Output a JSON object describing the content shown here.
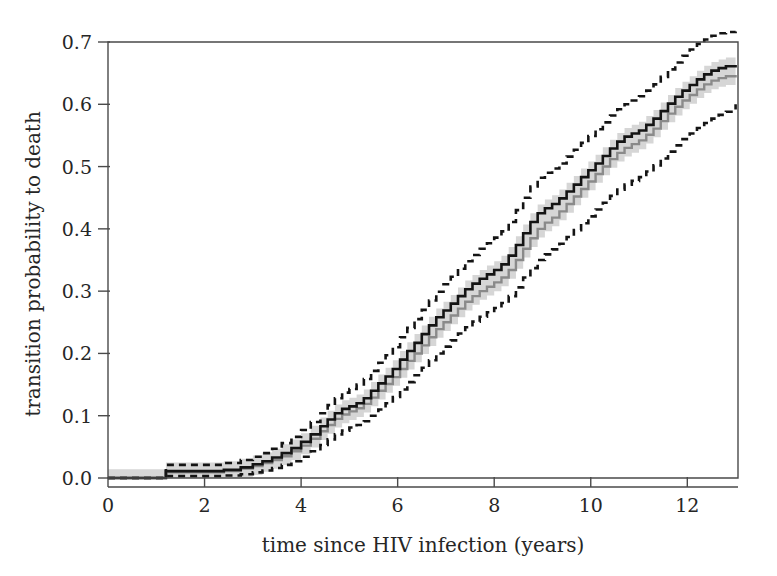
{
  "chart_data": {
    "type": "line",
    "title": "",
    "subtitle": "",
    "xlabel": "time since HIV infection (years)",
    "ylabel": "transition probability to death",
    "xlim": [
      0,
      13.05
    ],
    "ylim": [
      0.0,
      0.715
    ],
    "xticks": [
      0,
      2,
      4,
      6,
      8,
      10,
      12
    ],
    "xticklabels": [
      "0",
      "2",
      "4",
      "6",
      "8",
      "10",
      "12"
    ],
    "yticks": [
      0.0,
      0.1,
      0.2,
      0.3,
      0.4,
      0.5,
      0.6,
      0.7
    ],
    "yticklabels": [
      "0.0",
      "0.1",
      "0.2",
      "0.3",
      "0.4",
      "0.5",
      "0.6",
      "0.7"
    ],
    "grid": false,
    "legend": "none",
    "colors": {
      "estimate": "#141414",
      "second_estimate": "#8a8a8a",
      "confidence_band_fill": "#d6d6d6",
      "confidence_bound_line": "#141414",
      "axis": "#4a4a4a",
      "text": "#262626"
    },
    "step_interpolation": true,
    "series": [
      {
        "name": "estimate",
        "style": "solid-black",
        "x": [
          0.0,
          1.18,
          1.2,
          2.0,
          2.4,
          2.75,
          3.0,
          3.2,
          3.4,
          3.6,
          3.8,
          4.0,
          4.2,
          4.4,
          4.55,
          4.7,
          4.85,
          5.0,
          5.15,
          5.3,
          5.45,
          5.6,
          5.75,
          5.9,
          6.05,
          6.2,
          6.35,
          6.5,
          6.65,
          6.8,
          6.95,
          7.1,
          7.25,
          7.4,
          7.55,
          7.7,
          7.85,
          8.0,
          8.15,
          8.3,
          8.45,
          8.6,
          8.75,
          8.9,
          9.05,
          9.2,
          9.35,
          9.5,
          9.65,
          9.8,
          9.95,
          10.1,
          10.25,
          10.4,
          10.55,
          10.7,
          10.85,
          11.0,
          11.15,
          11.3,
          11.45,
          11.6,
          11.75,
          11.9,
          12.05,
          12.2,
          12.35,
          12.5,
          12.65,
          12.8,
          13.0
        ],
        "y": [
          0.0,
          0.0,
          0.011,
          0.011,
          0.013,
          0.017,
          0.022,
          0.027,
          0.033,
          0.04,
          0.048,
          0.058,
          0.07,
          0.083,
          0.094,
          0.104,
          0.111,
          0.115,
          0.12,
          0.128,
          0.14,
          0.152,
          0.163,
          0.175,
          0.19,
          0.204,
          0.217,
          0.231,
          0.245,
          0.258,
          0.269,
          0.28,
          0.292,
          0.303,
          0.312,
          0.32,
          0.327,
          0.334,
          0.343,
          0.357,
          0.374,
          0.393,
          0.411,
          0.425,
          0.433,
          0.44,
          0.449,
          0.46,
          0.471,
          0.483,
          0.494,
          0.505,
          0.517,
          0.529,
          0.54,
          0.548,
          0.553,
          0.558,
          0.567,
          0.577,
          0.589,
          0.601,
          0.612,
          0.622,
          0.631,
          0.64,
          0.648,
          0.654,
          0.658,
          0.661,
          0.663
        ]
      },
      {
        "name": "second-estimate",
        "style": "solid-gray",
        "x": [
          0.0,
          1.18,
          1.2,
          2.0,
          2.4,
          2.75,
          3.0,
          3.2,
          3.4,
          3.6,
          3.8,
          4.0,
          4.2,
          4.4,
          4.55,
          4.7,
          4.85,
          5.0,
          5.15,
          5.3,
          5.45,
          5.6,
          5.75,
          5.9,
          6.05,
          6.2,
          6.35,
          6.5,
          6.65,
          6.8,
          6.95,
          7.1,
          7.25,
          7.4,
          7.55,
          7.7,
          7.85,
          8.0,
          8.15,
          8.3,
          8.45,
          8.6,
          8.75,
          8.9,
          9.05,
          9.2,
          9.35,
          9.5,
          9.65,
          9.8,
          9.95,
          10.1,
          10.25,
          10.4,
          10.55,
          10.7,
          10.85,
          11.0,
          11.15,
          11.3,
          11.45,
          11.6,
          11.75,
          11.9,
          12.05,
          12.2,
          12.35,
          12.5,
          12.65,
          12.8,
          13.0
        ],
        "y": [
          0.0,
          0.0,
          0.009,
          0.009,
          0.011,
          0.015,
          0.019,
          0.024,
          0.029,
          0.035,
          0.043,
          0.052,
          0.063,
          0.075,
          0.085,
          0.095,
          0.102,
          0.107,
          0.112,
          0.119,
          0.129,
          0.14,
          0.151,
          0.162,
          0.175,
          0.188,
          0.2,
          0.213,
          0.226,
          0.239,
          0.25,
          0.261,
          0.272,
          0.283,
          0.292,
          0.3,
          0.307,
          0.314,
          0.322,
          0.334,
          0.35,
          0.368,
          0.385,
          0.4,
          0.41,
          0.418,
          0.428,
          0.44,
          0.452,
          0.464,
          0.476,
          0.488,
          0.5,
          0.512,
          0.522,
          0.53,
          0.536,
          0.542,
          0.551,
          0.561,
          0.573,
          0.585,
          0.596,
          0.606,
          0.615,
          0.624,
          0.632,
          0.638,
          0.642,
          0.645,
          0.647
        ]
      },
      {
        "name": "upper-confidence-bound",
        "style": "dotted",
        "x": [
          0.0,
          1.18,
          1.2,
          2.0,
          2.4,
          2.75,
          3.0,
          3.2,
          3.4,
          3.6,
          3.8,
          4.0,
          4.2,
          4.4,
          4.55,
          4.7,
          4.85,
          5.0,
          5.15,
          5.3,
          5.45,
          5.6,
          5.75,
          5.9,
          6.05,
          6.2,
          6.35,
          6.5,
          6.65,
          6.8,
          6.95,
          7.1,
          7.25,
          7.4,
          7.55,
          7.7,
          7.85,
          8.0,
          8.15,
          8.3,
          8.45,
          8.6,
          8.75,
          8.9,
          9.05,
          9.2,
          9.35,
          9.5,
          9.65,
          9.8,
          9.95,
          10.1,
          10.25,
          10.4,
          10.55,
          10.7,
          10.85,
          11.0,
          11.15,
          11.3,
          11.45,
          11.6,
          11.75,
          11.9,
          12.05,
          12.2,
          12.35,
          12.5,
          12.65,
          12.8,
          13.0
        ],
        "y": [
          0.0,
          0.0,
          0.021,
          0.021,
          0.024,
          0.029,
          0.034,
          0.04,
          0.047,
          0.056,
          0.066,
          0.077,
          0.09,
          0.104,
          0.117,
          0.128,
          0.137,
          0.143,
          0.15,
          0.159,
          0.172,
          0.185,
          0.197,
          0.21,
          0.226,
          0.241,
          0.255,
          0.27,
          0.285,
          0.299,
          0.311,
          0.323,
          0.336,
          0.348,
          0.358,
          0.368,
          0.377,
          0.386,
          0.396,
          0.411,
          0.43,
          0.45,
          0.468,
          0.482,
          0.49,
          0.497,
          0.505,
          0.516,
          0.527,
          0.538,
          0.549,
          0.56,
          0.571,
          0.582,
          0.592,
          0.6,
          0.606,
          0.613,
          0.622,
          0.632,
          0.644,
          0.656,
          0.667,
          0.678,
          0.688,
          0.697,
          0.704,
          0.71,
          0.714,
          0.716,
          0.717
        ]
      },
      {
        "name": "lower-confidence-bound",
        "style": "dotted",
        "x": [
          0.0,
          1.18,
          1.2,
          2.0,
          2.4,
          2.75,
          3.0,
          3.2,
          3.4,
          3.6,
          3.8,
          4.0,
          4.2,
          4.4,
          4.55,
          4.7,
          4.85,
          5.0,
          5.15,
          5.3,
          5.45,
          5.6,
          5.75,
          5.9,
          6.05,
          6.2,
          6.35,
          6.5,
          6.65,
          6.8,
          6.95,
          7.1,
          7.25,
          7.4,
          7.55,
          7.7,
          7.85,
          8.0,
          8.15,
          8.3,
          8.45,
          8.6,
          8.75,
          8.9,
          9.05,
          9.2,
          9.35,
          9.5,
          9.65,
          9.8,
          9.95,
          10.1,
          10.25,
          10.4,
          10.55,
          10.7,
          10.85,
          11.0,
          11.15,
          11.3,
          11.45,
          11.6,
          11.75,
          11.9,
          12.05,
          12.2,
          12.35,
          12.5,
          12.65,
          12.8,
          13.0
        ],
        "y": [
          0.0,
          0.0,
          0.003,
          0.003,
          0.004,
          0.006,
          0.009,
          0.012,
          0.016,
          0.021,
          0.027,
          0.034,
          0.043,
          0.053,
          0.062,
          0.07,
          0.076,
          0.081,
          0.085,
          0.091,
          0.1,
          0.11,
          0.12,
          0.13,
          0.142,
          0.154,
          0.165,
          0.177,
          0.189,
          0.2,
          0.211,
          0.221,
          0.232,
          0.242,
          0.251,
          0.259,
          0.266,
          0.273,
          0.281,
          0.292,
          0.306,
          0.322,
          0.337,
          0.35,
          0.359,
          0.367,
          0.376,
          0.387,
          0.398,
          0.409,
          0.42,
          0.431,
          0.442,
          0.453,
          0.463,
          0.471,
          0.477,
          0.483,
          0.492,
          0.502,
          0.513,
          0.524,
          0.534,
          0.544,
          0.553,
          0.562,
          0.57,
          0.577,
          0.583,
          0.588,
          0.6
        ]
      }
    ]
  }
}
